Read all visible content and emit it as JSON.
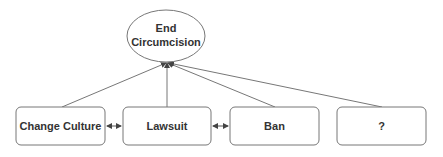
{
  "diagram": {
    "goal": {
      "id": "end-circumcision",
      "lines": [
        "End",
        "Circumcision"
      ]
    },
    "nodes": [
      {
        "id": "change-culture",
        "label": "Change Culture"
      },
      {
        "id": "lawsuit",
        "label": "Lawsuit"
      },
      {
        "id": "ban",
        "label": "Ban"
      },
      {
        "id": "unknown",
        "label": "?"
      }
    ],
    "edges": [
      {
        "from": "change-culture",
        "to": "end-circumcision",
        "type": "arrow"
      },
      {
        "from": "lawsuit",
        "to": "end-circumcision",
        "type": "arrow"
      },
      {
        "from": "ban",
        "to": "end-circumcision",
        "type": "arrow"
      },
      {
        "from": "unknown",
        "to": "end-circumcision",
        "type": "arrow"
      },
      {
        "from": "change-culture",
        "to": "lawsuit",
        "type": "bidirectional"
      },
      {
        "from": "lawsuit",
        "to": "ban",
        "type": "bidirectional"
      }
    ],
    "colors": {
      "stroke": "#777777",
      "text": "#333333",
      "background": "#ffffff"
    }
  }
}
